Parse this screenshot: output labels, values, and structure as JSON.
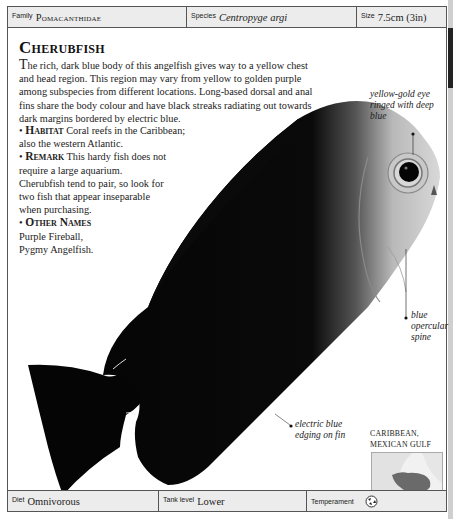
{
  "header": {
    "family": {
      "label": "Family",
      "value": "Pomacanthidae"
    },
    "species": {
      "label": "Species",
      "value": "Centropyge argi"
    },
    "size": {
      "label": "Size",
      "value": "7.5cm (3in)"
    }
  },
  "title": "Cherubfish",
  "intro": {
    "first_letter": "T",
    "text": "he rich, dark blue body of this angelfish gives way to a yellow chest and head region. This region may vary from yellow to golden purple among subspecies from different locations. Long-based dorsal and anal fins share the body colour and have black streaks radiating out towards dark margins bordered by electric blue."
  },
  "facts": [
    {
      "heading": "Habitat",
      "text": "Coral reefs in the Caribbean; also the western Atlantic."
    },
    {
      "heading": "Remark",
      "text": "This hardy fish does not require a large aquarium. Cherubfish tend to pair, so look for two fish that appear inseparable when purchasing."
    },
    {
      "heading": "Other Names",
      "text": "Purple Fireball, Pygmy Angelfish."
    }
  ],
  "annotations": {
    "eye": "yellow-gold eye ringed with deep blue",
    "spine": "blue opercular spine",
    "fin": "electric blue edging on fin"
  },
  "map": {
    "label_line1": "CARIBBEAN,",
    "label_line2": "MEXICAN GULF",
    "icon": "range-map"
  },
  "footer": {
    "diet": {
      "label": "Diet",
      "value": "Omnivorous"
    },
    "tank_level": {
      "label": "Tank level",
      "value": "Lower"
    },
    "temperament": {
      "label": "Temperament",
      "icon": "semi-aggressive-icon"
    }
  }
}
